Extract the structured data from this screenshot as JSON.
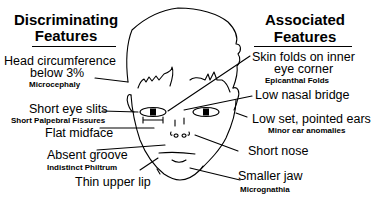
{
  "left_panel": {
    "heading_line1": "Discriminating",
    "heading_line2": "Features",
    "items": [
      {
        "label_line1": "Head circumference",
        "label_line2": "below 3%",
        "sublabel": "Microcephaly"
      },
      {
        "label": "Short eye slits",
        "sublabel": "Short Palpebral Fissures"
      },
      {
        "label": "Flat midface"
      },
      {
        "label": "Absent groove",
        "sublabel": "Indistinct Philtrum"
      },
      {
        "label": "Thin upper lip"
      }
    ]
  },
  "right_panel": {
    "heading_line1": "Associated",
    "heading_line2": "Features",
    "items": [
      {
        "label_line1": "Skin folds on inner",
        "label_line2": "eye corner",
        "sublabel": "Epicanthal Folds"
      },
      {
        "label": "Low nasal bridge"
      },
      {
        "label": "Low set, pointed ears",
        "sublabel": "Minor ear anomalies"
      },
      {
        "label": "Short nose"
      },
      {
        "label": "Smaller jaw",
        "sublabel": "Micrognathia"
      }
    ]
  },
  "illustration": {
    "subject": "child-face-line-drawing",
    "stroke_color": "#000000",
    "background": "#ffffff"
  }
}
